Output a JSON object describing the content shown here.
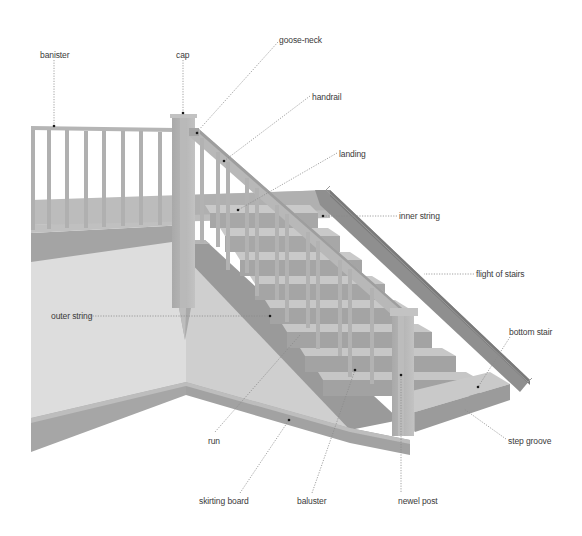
{
  "diagram": {
    "labels": [
      {
        "id": "banister",
        "text": "banister",
        "x": 40,
        "y": 50
      },
      {
        "id": "cap",
        "text": "cap",
        "x": 176,
        "y": 50
      },
      {
        "id": "goose-neck",
        "text": "goose-neck",
        "x": 279,
        "y": 35
      },
      {
        "id": "handrail",
        "text": "handrail",
        "x": 312,
        "y": 92
      },
      {
        "id": "landing",
        "text": "landing",
        "x": 339,
        "y": 149
      },
      {
        "id": "inner-string",
        "text": "inner string",
        "x": 399,
        "y": 211
      },
      {
        "id": "flight-of-stairs",
        "text": "flight of stairs",
        "x": 476,
        "y": 269
      },
      {
        "id": "bottom-stair",
        "text": "bottom stair",
        "x": 509,
        "y": 327
      },
      {
        "id": "outer-string",
        "text": "outer string",
        "x": 51,
        "y": 313
      },
      {
        "id": "run",
        "text": "run",
        "x": 208,
        "y": 436
      },
      {
        "id": "step-groove",
        "text": "step groove",
        "x": 508,
        "y": 436
      },
      {
        "id": "skirting-board",
        "text": "skirting board",
        "x": 199,
        "y": 496
      },
      {
        "id": "baluster",
        "text": "baluster",
        "x": 297,
        "y": 496
      },
      {
        "id": "newel-post",
        "text": "newel post",
        "x": 398,
        "y": 496
      }
    ],
    "colors": {
      "background": "#ffffff",
      "wall": "#d9d9d9",
      "wall_shadow": "#c4c4c4",
      "wood_light": "#b8b8b8",
      "wood_mid": "#9e9e9e",
      "wood_dark": "#7d7d7d",
      "leader": "#8a8a8a",
      "text": "#3a3a3a"
    }
  }
}
